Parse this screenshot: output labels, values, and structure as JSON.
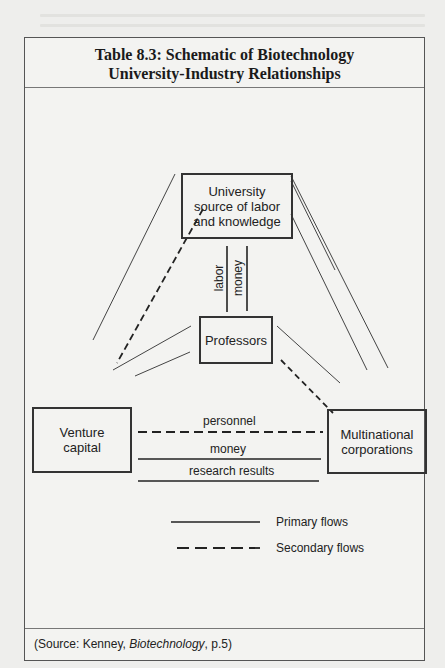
{
  "title": {
    "line1": "Table 8.3: Schematic of Biotechnology",
    "line2": "University-Industry Relationships"
  },
  "nodes": {
    "university": {
      "line1": "University",
      "line2": "source of labor",
      "line3": "and knowledge"
    },
    "professors": {
      "label": "Professors"
    },
    "venture_capital": {
      "line1": "Venture",
      "line2": "capital"
    },
    "multinational": {
      "line1": "Multinational",
      "line2": "corporations"
    }
  },
  "flows": {
    "labor": "labor",
    "money_vertical": "money",
    "personnel": "personnel",
    "money_horizontal": "money",
    "research_results": "research results"
  },
  "edges": [
    {
      "from": "university",
      "to": "professors",
      "label": "labor",
      "type": "primary"
    },
    {
      "from": "professors",
      "to": "university",
      "label": "money",
      "type": "primary"
    },
    {
      "from": "university",
      "to": "venture_capital",
      "label": "",
      "type": "primary"
    },
    {
      "from": "university",
      "to": "venture_capital",
      "label": "",
      "type": "secondary"
    },
    {
      "from": "university",
      "to": "multinational",
      "label": "",
      "type": "primary"
    },
    {
      "from": "university",
      "to": "multinational",
      "label": "",
      "type": "primary"
    },
    {
      "from": "professors",
      "to": "venture_capital",
      "label": "",
      "type": "primary"
    },
    {
      "from": "professors",
      "to": "venture_capital",
      "label": "",
      "type": "primary"
    },
    {
      "from": "professors",
      "to": "multinational",
      "label": "",
      "type": "primary"
    },
    {
      "from": "professors",
      "to": "multinational",
      "label": "",
      "type": "secondary"
    },
    {
      "from": "venture_capital",
      "to": "multinational",
      "label": "personnel",
      "type": "secondary"
    },
    {
      "from": "venture_capital",
      "to": "multinational",
      "label": "money",
      "type": "primary"
    },
    {
      "from": "venture_capital",
      "to": "multinational",
      "label": "research results",
      "type": "primary"
    }
  ],
  "legend": {
    "primary": "Primary flows",
    "secondary": "Secondary flows"
  },
  "source": {
    "prefix": "(Source: Kenney, ",
    "book": "Biotechnology",
    "suffix": ", p.5)"
  }
}
